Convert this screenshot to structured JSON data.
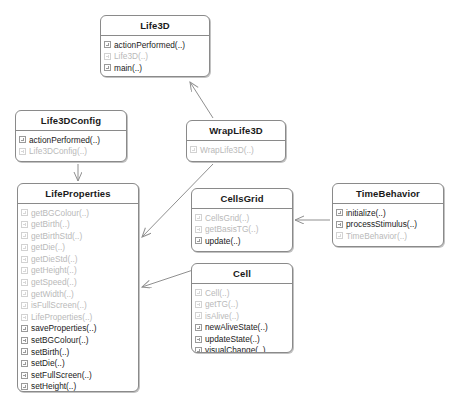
{
  "diagram": {
    "type": "uml-class-diagram",
    "colors": {
      "background": "#ffffff",
      "box_border": "#8a8a8a",
      "text": "#1a1a1a",
      "dim_text": "#b9b9b9",
      "connector": "#8f8f8f"
    },
    "classes": [
      {
        "id": "life3d",
        "name": "Life3D",
        "x": 100,
        "y": 15,
        "w": 110,
        "h": 62,
        "members": [
          {
            "label": "actionPerformed(..)",
            "dim": false,
            "icon": "method-icon"
          },
          {
            "label": "Life3D(..)",
            "dim": true,
            "icon": "method-icon"
          },
          {
            "label": "main(..)",
            "dim": false,
            "icon": "method-icon"
          }
        ]
      },
      {
        "id": "life3dconfig",
        "name": "Life3DConfig",
        "x": 15,
        "y": 110,
        "w": 112,
        "h": 52,
        "members": [
          {
            "label": "actionPerformed(..)",
            "dim": false,
            "icon": "method-icon"
          },
          {
            "label": "Life3DConfig(..)",
            "dim": true,
            "icon": "method-icon"
          }
        ]
      },
      {
        "id": "wraplife3d",
        "name": "WrapLife3D",
        "x": 186,
        "y": 120,
        "w": 100,
        "h": 42,
        "members": [
          {
            "label": "WrapLife3D(..)",
            "dim": true,
            "icon": "method-icon"
          }
        ]
      },
      {
        "id": "lifeproperties",
        "name": "LifeProperties",
        "x": 17,
        "y": 183,
        "w": 122,
        "h": 209,
        "members": [
          {
            "label": "getBGColour(..)",
            "dim": true,
            "icon": "method-icon"
          },
          {
            "label": "getBirth(..)",
            "dim": true,
            "icon": "method-icon"
          },
          {
            "label": "getBirthStd(..)",
            "dim": true,
            "icon": "method-icon"
          },
          {
            "label": "getDie(..)",
            "dim": true,
            "icon": "method-icon"
          },
          {
            "label": "getDieStd(..)",
            "dim": true,
            "icon": "method-icon"
          },
          {
            "label": "getHeight(..)",
            "dim": true,
            "icon": "method-icon"
          },
          {
            "label": "getSpeed(..)",
            "dim": true,
            "icon": "method-icon"
          },
          {
            "label": "getWidth(..)",
            "dim": true,
            "icon": "method-icon"
          },
          {
            "label": "isFullScreen(..)",
            "dim": true,
            "icon": "method-icon"
          },
          {
            "label": "LifeProperties(..)",
            "dim": true,
            "icon": "method-icon"
          },
          {
            "label": "saveProperties(..)",
            "dim": false,
            "icon": "method-icon"
          },
          {
            "label": "setBGColour(..)",
            "dim": false,
            "icon": "method-icon"
          },
          {
            "label": "setBirth(..)",
            "dim": false,
            "icon": "method-icon"
          },
          {
            "label": "setDie(..)",
            "dim": false,
            "icon": "method-icon"
          },
          {
            "label": "setFullScreen(..)",
            "dim": false,
            "icon": "method-icon"
          },
          {
            "label": "setHeight(..)",
            "dim": false,
            "icon": "method-icon"
          },
          {
            "label": "setSpeed(..)",
            "dim": false,
            "icon": "method-icon"
          },
          {
            "label": "setWidth(..)",
            "dim": false,
            "icon": "method-icon"
          }
        ]
      },
      {
        "id": "cellsgrid",
        "name": "CellsGrid",
        "x": 191,
        "y": 188,
        "w": 102,
        "h": 64,
        "members": [
          {
            "label": "CellsGrid(..)",
            "dim": true,
            "icon": "method-icon"
          },
          {
            "label": "getBasisTG(..)",
            "dim": true,
            "icon": "method-icon"
          },
          {
            "label": "update(..)",
            "dim": false,
            "icon": "method-icon"
          }
        ]
      },
      {
        "id": "cell",
        "name": "Cell",
        "x": 191,
        "y": 263,
        "w": 102,
        "h": 90,
        "members": [
          {
            "label": "Cell(..)",
            "dim": true,
            "icon": "method-icon"
          },
          {
            "label": "getTG(..)",
            "dim": true,
            "icon": "method-icon"
          },
          {
            "label": "isAlive(..)",
            "dim": true,
            "icon": "method-icon"
          },
          {
            "label": "newAliveState(..)",
            "dim": false,
            "icon": "method-icon"
          },
          {
            "label": "updateState(..)",
            "dim": false,
            "icon": "method-icon"
          },
          {
            "label": "visualChange(..)",
            "dim": false,
            "icon": "method-icon"
          }
        ]
      },
      {
        "id": "timebehavior",
        "name": "TimeBehavior",
        "x": 332,
        "y": 183,
        "w": 112,
        "h": 64,
        "members": [
          {
            "label": "initialize(..)",
            "dim": false,
            "icon": "method-icon"
          },
          {
            "label": "processStimulus(..)",
            "dim": false,
            "icon": "method-icon"
          },
          {
            "label": "TimeBehavior(..)",
            "dim": true,
            "icon": "method-icon"
          }
        ]
      }
    ],
    "connectors": [
      {
        "id": "wraplife3d-to-life3d",
        "from": "wraplife3d",
        "to": "life3d",
        "arrow": "open",
        "path": "M 213 118 L 190 82"
      },
      {
        "id": "life3dconfig-to-lifeproperties",
        "from": "life3dconfig",
        "to": "lifeproperties",
        "arrow": "open",
        "path": "M 78 164 L 78 181"
      },
      {
        "id": "wraplife3d-to-lifeproperties",
        "from": "wraplife3d",
        "to": "lifeproperties",
        "arrow": "open",
        "path": "M 213 164 L 142 237"
      },
      {
        "id": "cell-to-lifeproperties",
        "from": "cell",
        "to": "lifeproperties",
        "arrow": "open",
        "path": "M 205 266 L 142 287"
      },
      {
        "id": "timebehavior-to-cellsgrid",
        "from": "timebehavior",
        "to": "cellsgrid",
        "arrow": "open",
        "path": "M 330 220 L 295 220"
      }
    ]
  }
}
